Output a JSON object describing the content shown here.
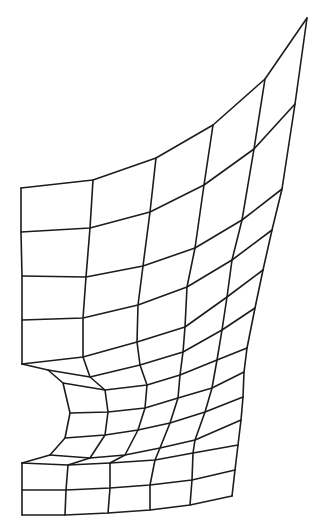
{
  "figure": {
    "stroke_color": "#1c1c1c",
    "background": "#ffffff"
  },
  "mesh": {
    "rows": [
      [
        [
          21,
          188
        ],
        [
          93,
          180
        ],
        [
          156,
          158
        ],
        [
          213,
          125
        ],
        [
          265,
          79
        ],
        [
          307,
          18
        ]
      ],
      [
        [
          21,
          232
        ],
        [
          90,
          228
        ],
        [
          150,
          212
        ],
        [
          204,
          185
        ],
        [
          254,
          149
        ],
        [
          295,
          104
        ]
      ],
      [
        [
          22,
          276
        ],
        [
          86,
          277
        ],
        [
          143,
          266
        ],
        [
          195,
          248
        ],
        [
          242,
          220
        ],
        [
          282,
          189
        ]
      ],
      [
        [
          22,
          320
        ],
        [
          83,
          318
        ],
        [
          138,
          305
        ],
        [
          187,
          287
        ],
        [
          232,
          260
        ],
        [
          272,
          230
        ]
      ],
      [
        [
          22,
          364
        ],
        [
          83,
          357
        ],
        [
          137,
          342
        ],
        [
          185,
          327
        ],
        [
          227,
          297
        ],
        [
          263,
          270
        ]
      ],
      [
        [
          48,
          370
        ],
        [
          90,
          377
        ],
        [
          140,
          365
        ],
        [
          183,
          352
        ],
        [
          222,
          330
        ],
        [
          255,
          308
        ]
      ],
      [
        [
          63,
          383
        ],
        [
          105,
          390
        ],
        [
          147,
          385
        ],
        [
          180,
          375
        ],
        [
          217,
          360
        ],
        [
          247,
          348
        ]
      ],
      [
        [
          70,
          413
        ],
        [
          108,
          412
        ],
        [
          145,
          408
        ],
        [
          178,
          398
        ],
        [
          212,
          388
        ],
        [
          244,
          372
        ]
      ],
      [
        [
          65,
          438
        ],
        [
          105,
          435
        ],
        [
          138,
          430
        ],
        [
          170,
          423
        ],
        [
          205,
          412
        ],
        [
          243,
          397
        ]
      ],
      [
        [
          50,
          455
        ],
        [
          90,
          458
        ],
        [
          125,
          455
        ],
        [
          160,
          448
        ],
        [
          195,
          440
        ],
        [
          241,
          420
        ]
      ],
      [
        [
          22,
          463
        ],
        [
          68,
          465
        ],
        [
          110,
          463
        ],
        [
          155,
          460
        ],
        [
          193,
          453
        ],
        [
          238,
          445
        ]
      ],
      [
        [
          22,
          490
        ],
        [
          66,
          490
        ],
        [
          110,
          488
        ],
        [
          150,
          485
        ],
        [
          192,
          480
        ],
        [
          235,
          470
        ]
      ],
      [
        [
          22,
          515
        ],
        [
          65,
          515
        ],
        [
          108,
          513
        ],
        [
          150,
          510
        ],
        [
          190,
          505
        ],
        [
          232,
          496
        ]
      ]
    ],
    "left_notch_edges": [
      [
        [
          22,
          364
        ],
        [
          48,
          370
        ]
      ],
      [
        [
          22,
          463
        ],
        [
          50,
          455
        ]
      ]
    ]
  }
}
